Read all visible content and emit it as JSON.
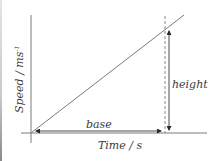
{
  "diagram": {
    "type": "speed-time graph",
    "y_axis_label": "Speed / ms",
    "y_axis_label_superscript": "-1",
    "x_axis_label": "Time / s",
    "annotations": {
      "base": "base",
      "height": "height"
    },
    "colors": {
      "line": "#7a7a7a",
      "text": "#3a3a3a",
      "background": "#ffffff"
    }
  }
}
